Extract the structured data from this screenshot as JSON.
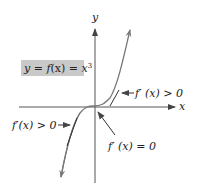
{
  "diagram": {
    "title_box": {
      "text_y": "y",
      "text_eq1": " = ",
      "text_f": "f",
      "text_x": "(x)",
      "text_eq2": " = ",
      "text_base": "x",
      "text_exp": "3",
      "background": "#c9c9c9"
    },
    "axes": {
      "x_label": "x",
      "y_label": "y",
      "color": "#555555"
    },
    "curve": {
      "function": "y = x^3",
      "color": "#777777"
    },
    "annotations": [
      {
        "id": "upper-right",
        "text": "f′ (x) > 0"
      },
      {
        "id": "lower-left",
        "text": "f′(x) > 0"
      },
      {
        "id": "origin",
        "text": "f′ (x) = 0"
      }
    ]
  }
}
